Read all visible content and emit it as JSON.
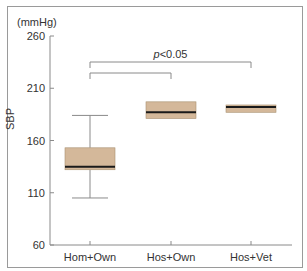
{
  "chart_data": {
    "type": "box",
    "title": "",
    "xlabel": "",
    "ylabel": "SBP",
    "yunit": "(mmHg)",
    "ylim": [
      60,
      260
    ],
    "yticks": [
      60,
      110,
      160,
      210,
      260
    ],
    "grid": false,
    "categories": [
      "Hom+Own",
      "Hos+Own",
      "Hos+Vet"
    ],
    "boxes": [
      {
        "name": "Hom+Own",
        "whisker_low": 105,
        "q1": 132,
        "median": 135,
        "q3": 153,
        "whisker_high": 184
      },
      {
        "name": "Hos+Own",
        "whisker_low": 181,
        "q1": 181,
        "median": 187,
        "q3": 197,
        "whisker_high": 197
      },
      {
        "name": "Hos+Vet",
        "whisker_low": 187,
        "q1": 187,
        "median": 192,
        "q3": 194,
        "whisker_high": 194
      }
    ],
    "annotations": [
      {
        "text": "p<0.05",
        "bracket": [
          "Hom+Own",
          "Hos+Vet"
        ]
      },
      {
        "text": "",
        "bracket": [
          "Hom+Own",
          "Hos+Own"
        ]
      }
    ],
    "colors": {
      "box_fill": "#d4b89a",
      "box_edge": "#a89070",
      "median": "#1a1a1a",
      "axis": "#8a8a8a"
    }
  }
}
